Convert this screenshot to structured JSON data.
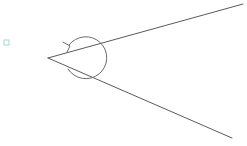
{
  "figure": {
    "width": 247,
    "height": 146,
    "background_color": "#ffffff",
    "line_color": "#5a5a5a",
    "arc_color": "#6b6b6b",
    "marker_color": "#a8d8d0"
  },
  "angle": {
    "vertex": {
      "x": 48,
      "y": 58
    },
    "upper_ray_end": {
      "x": 243,
      "y": 4
    },
    "lower_ray_end": {
      "x": 232,
      "y": 138
    },
    "upper_ray_path": "M 48 58 L 243 4",
    "lower_ray_path": "M 48 58 L 232 138"
  },
  "rotation_arrow": {
    "center": {
      "x": 50,
      "y": 58
    },
    "radius": 21,
    "direction": "clockwise",
    "arc_path": "M 68 69 A 21 21 0 1 0 69 45",
    "arrow_head_path": "M 63 42 L 70 46 L 67 52",
    "arrow_tip": {
      "x": 70,
      "y": 46
    }
  },
  "corner_marker": {
    "shape": "small-square",
    "x": 4,
    "y": 40,
    "size": 5,
    "color": "#a8d8d0"
  }
}
